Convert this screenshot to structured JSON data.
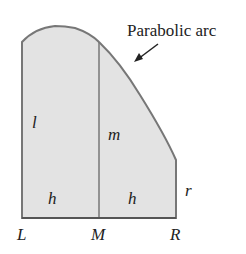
{
  "diagram": {
    "callout": "Parabolic arc",
    "labels": {
      "left_height": "l",
      "mid_height": "m",
      "right_height": "r",
      "left_width": "h",
      "right_width": "h",
      "point_L": "L",
      "point_M": "M",
      "point_R": "R"
    },
    "colors": {
      "fill": "#e3e3e3",
      "stroke": "#777777",
      "text": "#222222"
    }
  }
}
